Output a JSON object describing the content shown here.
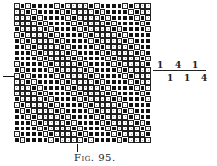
{
  "figure": {
    "caption": "Fig. 95.",
    "rows": 24,
    "cols": 24,
    "weave_repeat": "BWBBBBWBWWWW",
    "first_row_shift": 1,
    "row_shift": 1,
    "colors": {
      "raiser": "#111111",
      "sinker": "#ffffff"
    }
  },
  "formula": {
    "top": [
      "1",
      "4",
      "1"
    ],
    "bottom": [
      "1",
      "1",
      "4"
    ]
  }
}
